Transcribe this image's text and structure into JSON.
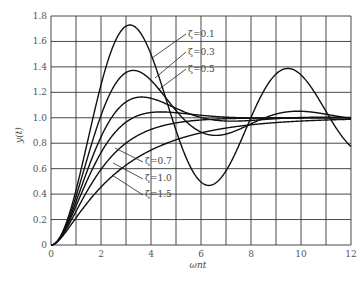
{
  "chart_data": {
    "type": "line",
    "title": "",
    "xlabel": "ωnt",
    "ylabel": "y(t)",
    "xlim": [
      0,
      12
    ],
    "ylim": [
      0,
      1.8
    ],
    "xticks": [
      "0",
      "2",
      "4",
      "6",
      "8",
      "10",
      "12"
    ],
    "yticks": [
      "0",
      "0.2",
      "0.4",
      "0.6",
      "0.8",
      "1.0",
      "1.2",
      "1.4",
      "1.6",
      "1.8"
    ],
    "grid": true,
    "series": [
      {
        "name": "ζ=0.1",
        "zeta": 0.1,
        "peak": {
          "x": 3.2,
          "y": 1.73
        }
      },
      {
        "name": "ζ=0.3",
        "zeta": 0.3,
        "peak": {
          "x": 3.3,
          "y": 1.37
        }
      },
      {
        "name": "ζ=0.5",
        "zeta": 0.5,
        "peak": {
          "x": 3.6,
          "y": 1.16
        }
      },
      {
        "name": "ζ=0.7",
        "zeta": 0.7,
        "peak": {
          "x": 4.4,
          "y": 1.05
        }
      },
      {
        "name": "ζ=1.0",
        "zeta": 1.0
      },
      {
        "name": "ζ=1.5",
        "zeta": 1.5
      }
    ],
    "annotations": [
      "ζ=0.1",
      "ζ=0.3",
      "ζ=0.5",
      "ζ=0.7",
      "ζ=1.0",
      "ζ=1.5"
    ]
  }
}
